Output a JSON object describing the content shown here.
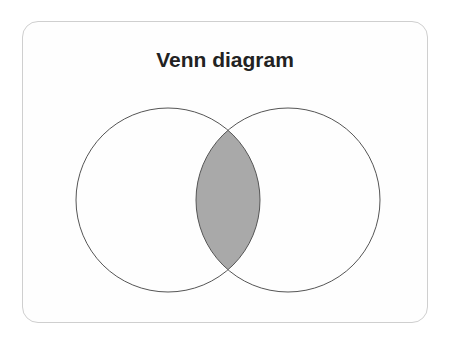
{
  "diagram": {
    "title": "Venn diagram",
    "type": "venn",
    "sets": [
      {
        "name": "set-a",
        "cx": 168,
        "cy": 200,
        "r": 92
      },
      {
        "name": "set-b",
        "cx": 288,
        "cy": 200,
        "r": 92
      }
    ],
    "intersection_fill": "#a9a9a9",
    "stroke_color": "#555555",
    "background": "#ffffff"
  }
}
